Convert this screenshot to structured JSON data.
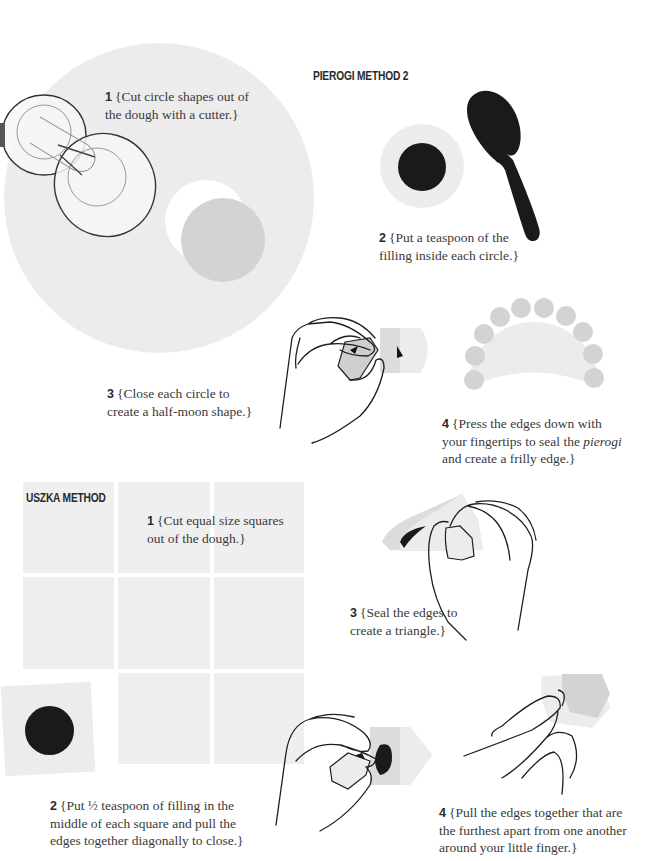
{
  "colors": {
    "dough": "#ececec",
    "dough_dark": "#d3d3d3",
    "filling": "#1a1a1a",
    "line": "#1e1e1e",
    "text": "#3a3a3a"
  },
  "pierogi_method_2": {
    "heading": "PIEROGI METHOD 2",
    "steps": [
      {
        "num": "1",
        "text": "{Cut circle shapes out of the dough with a cutter.}",
        "line1": "{Cut circle shapes out of",
        "line2": "the dough with a cutter.}",
        "illustration": "dough-circle-with-cutter"
      },
      {
        "num": "2",
        "text": "{Put a teaspoon of the filling inside each circle.}",
        "line1": "{Put a teaspoon of the",
        "line2": "filling inside each circle.}",
        "illustration": "filling-circle-and-spoon"
      },
      {
        "num": "3",
        "text": "{Close each circle to create a half-moon shape.}",
        "line1": "{Close each circle to",
        "line2": "create a half-moon shape.}",
        "illustration": "hand-folding-circle"
      },
      {
        "num": "4",
        "text": "{Press the edges down with your fingertips to seal the pierogi and create a frilly edge.}",
        "line1": "{Press the edges down with",
        "line2a": "your fingertips to seal the ",
        "line2_italic": "pierogi",
        "line3": "and create a frilly edge.}",
        "illustration": "frilly-half-moon"
      }
    ]
  },
  "uszka_method": {
    "heading": "USZKA METHOD",
    "steps": [
      {
        "num": "1",
        "text": "{Cut equal size squares out of the dough.}",
        "line1": "{Cut equal size squares",
        "line2": "out of the dough.}",
        "illustration": "dough-square-grid"
      },
      {
        "num": "2",
        "text": "{Put ½ teaspoon of filling in the middle of each square and pull the edges together diagonally to close.}",
        "line1": "{Put ½ teaspoon of filling in the",
        "line2": "middle of each square and pull the",
        "line3": "edges together diagonally to close.}",
        "illustration": "square-with-filling"
      },
      {
        "num": "3",
        "text": "{Seal the edges to create a triangle.}",
        "line1": "{Seal the edges to",
        "line2": "create a triangle.}",
        "illustration": "hand-sealing-triangle"
      },
      {
        "num": "4",
        "text": "{Pull the edges together that are the furthest apart from one another around your little finger.}",
        "line1": "{Pull the edges together that are",
        "line2": "the furthest apart from one another",
        "line3": "around your little finger.}",
        "illustration": "fingers-wrapping-uszka"
      }
    ]
  }
}
